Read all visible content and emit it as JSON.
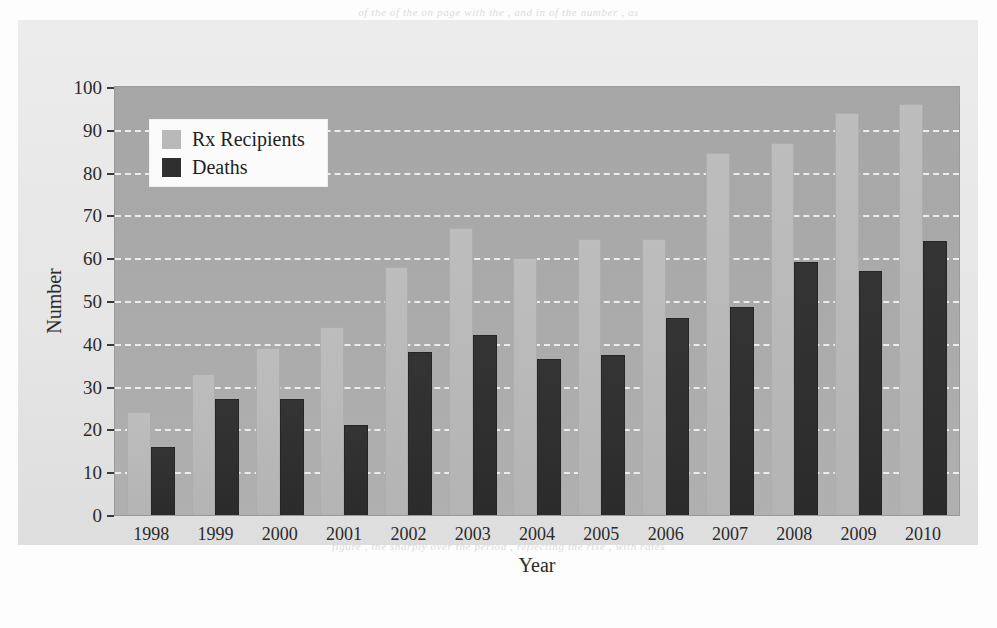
{
  "page": {
    "bleed_top": "of the  of the  on page  with  the  , and  in  of  the  number  , as",
    "bleed_bottom": "figure  , the  sharply  over the  period  , reflecting  the  rise  ,  with  rates"
  },
  "legend": {
    "position": "top-left",
    "entries": [
      {
        "label": "Rx Recipients",
        "color": "#b9b9b9",
        "swatch": "legend-swatch-rx"
      },
      {
        "label": "Deaths",
        "color": "#2f2f2f",
        "swatch": "legend-swatch-deaths"
      }
    ]
  },
  "axes": {
    "x_title": "Year",
    "y_title": "Number",
    "y_ticks": [
      "100",
      "90",
      "80",
      "70",
      "60",
      "50",
      "40",
      "30",
      "20",
      "10",
      "0"
    ]
  },
  "chart_data": {
    "type": "bar",
    "title": "",
    "xlabel": "Year",
    "ylabel": "Number",
    "ylim": [
      0,
      100
    ],
    "ytick_step": 10,
    "grid": true,
    "grid_style": "dashed-white-horizontal",
    "legend_position": "top-left",
    "plot_background": "#a8a8a8",
    "figure_background": "#e8e8e8",
    "categories": [
      "1998",
      "1999",
      "2000",
      "2001",
      "2002",
      "2003",
      "2004",
      "2005",
      "2006",
      "2007",
      "2008",
      "2009",
      "2010"
    ],
    "series": [
      {
        "name": "Rx Recipients",
        "color": "#b9b9b9",
        "values": [
          24,
          33,
          39,
          44,
          58,
          67,
          60,
          64.5,
          64.5,
          84.5,
          87,
          94,
          96
        ]
      },
      {
        "name": "Deaths",
        "color": "#2f2f2f",
        "values": [
          16,
          27,
          27,
          21,
          38,
          42,
          36.5,
          37.5,
          46,
          48.5,
          59,
          57,
          64
        ]
      }
    ]
  }
}
